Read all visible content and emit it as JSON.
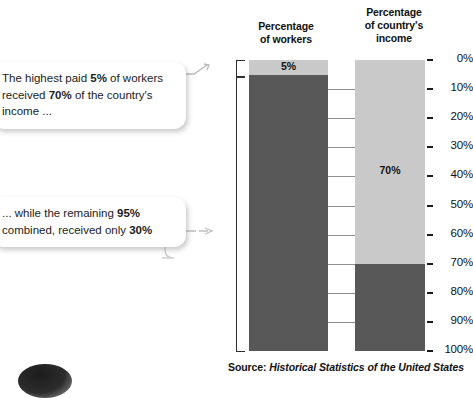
{
  "headers": {
    "workers": "Percentage\nof workers",
    "workers_line1": "Percentage",
    "workers_line2": "of workers",
    "income_line1": "Percentage",
    "income_line2": "of country's",
    "income_line3": "income"
  },
  "callouts": [
    {
      "id": "callout-1",
      "prefix": "The highest paid ",
      "bold1": "5%",
      "middle1": " of workers received ",
      "bold2": "70%",
      "suffix": " of the country's income ..."
    },
    {
      "id": "callout-2",
      "prefix": "... while the remaining ",
      "bold1": "95%",
      "middle1": " combined, received only ",
      "bold2": "30%",
      "suffix": ""
    }
  ],
  "bar_labels": {
    "workers_top": "5%",
    "income_top": "70%"
  },
  "source": {
    "prefix": "Source: ",
    "title": "Historical Statistics of the United States"
  },
  "colors": {
    "light_gray": "#c9c9c9",
    "dark_gray": "#585858",
    "text": "#111111",
    "connector": "#8e8e8e"
  },
  "chart_data": {
    "type": "bar",
    "orientation": "vertical-stacked",
    "axis": {
      "position": "right",
      "direction": "top-to-bottom",
      "min": 0,
      "max": 100,
      "unit": "%",
      "tick_step": 10,
      "tick_labels": [
        "0%",
        "10%",
        "20%",
        "30%",
        "40%",
        "50%",
        "60%",
        "70%",
        "80%",
        "90%",
        "100%"
      ],
      "tick_values": [
        0,
        10,
        20,
        30,
        40,
        50,
        60,
        70,
        80,
        90,
        100
      ],
      "grid": "connector-lines-between-bars"
    },
    "ylim": [
      0,
      100
    ],
    "xlabel": "",
    "ylabel": "Percentage",
    "legend": "none",
    "categories": [
      "Percentage of workers",
      "Percentage of country's income"
    ],
    "series": [
      {
        "name": "Highest paid group",
        "color": "#c9c9c9",
        "values": [
          5,
          70
        ],
        "labels": [
          "5%",
          "70%"
        ]
      },
      {
        "name": "Remaining workers",
        "color": "#585858",
        "values": [
          95,
          30
        ],
        "labels": [
          "95%",
          "30%"
        ]
      }
    ],
    "bars": [
      {
        "category": "Percentage of workers",
        "segments": [
          {
            "name": "Highest paid 5% of workers",
            "start": 0,
            "end": 5,
            "value": 5,
            "label": "5%",
            "color": "#c9c9c9",
            "label_shown": true
          },
          {
            "name": "Remaining 95% of workers",
            "start": 5,
            "end": 100,
            "value": 95,
            "label": "95%",
            "color": "#585858",
            "label_shown": false
          }
        ]
      },
      {
        "category": "Percentage of country's income",
        "segments": [
          {
            "name": "Income of highest paid 5%",
            "start": 0,
            "end": 70,
            "value": 70,
            "label": "70%",
            "color": "#c9c9c9",
            "label_shown": true
          },
          {
            "name": "Income of remaining 95%",
            "start": 70,
            "end": 100,
            "value": 30,
            "label": "30%",
            "color": "#585858",
            "label_shown": false
          }
        ]
      }
    ],
    "brackets": [
      {
        "name": "top-5-percent-bracket",
        "from": 0,
        "to": 5
      },
      {
        "name": "bottom-95-percent-bracket",
        "from": 5,
        "to": 100
      }
    ],
    "annotations": [
      "The highest paid 5% of workers received 70% of the country's income ...",
      "... while the remaining 95% combined, received only 30%"
    ],
    "source": "Source: Historical Statistics of the United States"
  }
}
